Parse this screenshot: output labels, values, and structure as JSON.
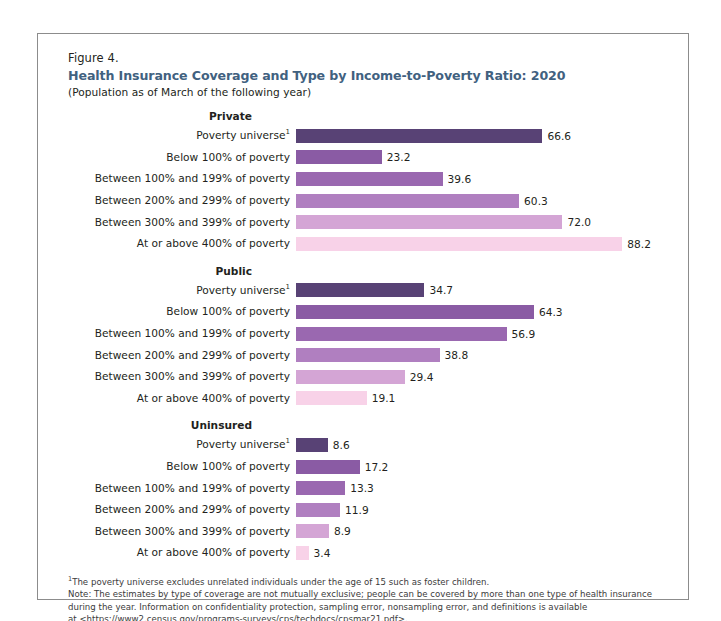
{
  "figure": {
    "number": "Figure 4.",
    "title": "Health Insurance Coverage and Type by Income-to-Poverty Ratio: 2020",
    "subtitle": "(Population as of March of the following year)",
    "title_color": "#41617f"
  },
  "chart_data": {
    "type": "bar",
    "orientation": "horizontal",
    "title": "Health Insurance Coverage and Type by Income-to-Poverty Ratio: 2020",
    "subtitle": "(Population as of March of the following year)",
    "xlabel": "",
    "ylabel": "",
    "xlim": [
      0,
      88.2
    ],
    "grid": false,
    "legend": "none",
    "categories": [
      "Poverty universe",
      "Below 100% of poverty",
      "Between 100% and 199% of poverty",
      "Between 200% and 299% of poverty",
      "Between 300% and 399% of poverty",
      "At or above 400% of poverty"
    ],
    "category_colors": [
      "#584275",
      "#8a5ba4",
      "#9a68b0",
      "#b07fc0",
      "#d4a5d5",
      "#f8d2e8"
    ],
    "panels": [
      {
        "name": "Private",
        "values": [
          66.6,
          23.2,
          39.6,
          60.3,
          72.0,
          88.2
        ],
        "labels": [
          "66.6",
          "23.2",
          "39.6",
          "60.3",
          "72.0",
          "88.2"
        ]
      },
      {
        "name": "Public",
        "values": [
          34.7,
          64.3,
          56.9,
          38.8,
          29.4,
          19.1
        ],
        "labels": [
          "34.7",
          "64.3",
          "56.9",
          "38.8",
          "29.4",
          "19.1"
        ]
      },
      {
        "name": "Uninsured",
        "values": [
          8.6,
          17.2,
          13.3,
          11.9,
          8.9,
          3.4
        ],
        "labels": [
          "8.6",
          "17.2",
          "13.3",
          "11.9",
          "8.9",
          "3.4"
        ]
      }
    ]
  },
  "notes": {
    "footnote_marker": "1",
    "footnote": "The poverty universe excludes unrelated individuals under the age of 15 such as foster children.",
    "note_line1": "Note: The estimates by type of coverage are not mutually exclusive; people can be covered by more than one type of health insurance",
    "note_line2": "during the year. Information on confidentiality protection, sampling error, nonsampling error, and definitions is available",
    "note_line3": "at <https://www2.census.gov/programs-surveys/cps/techdocs/cpsmar21.pdf>.",
    "source": "Source: U.S. Census Bureau, Current Population Survey, 2021 Annual Social and Economic Supplement (CPS ASEC)."
  }
}
